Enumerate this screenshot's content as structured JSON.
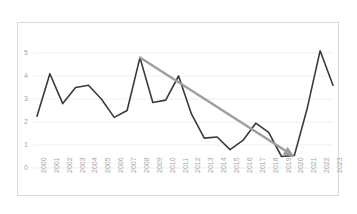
{
  "chart_data": {
    "type": "line",
    "title": "",
    "xlabel": "",
    "ylabel": "",
    "categories": [
      "2000",
      "2001",
      "2002",
      "2003",
      "2004",
      "2005",
      "2006",
      "2007",
      "2008",
      "2009",
      "2010",
      "2011",
      "2012",
      "2013",
      "2014",
      "2015",
      "2016",
      "2017",
      "2018",
      "2019",
      "2020",
      "2021",
      "2022",
      "2023"
    ],
    "values": [
      2.25,
      4.1,
      2.8,
      3.5,
      3.6,
      3.0,
      2.2,
      2.5,
      4.8,
      2.85,
      2.95,
      4.0,
      2.35,
      1.3,
      1.35,
      0.8,
      1.2,
      1.95,
      1.55,
      0.5,
      0.55,
      2.6,
      5.1,
      3.6
    ],
    "ylim": [
      0,
      5.6
    ],
    "yticks": [
      "0",
      "1",
      "2",
      "3",
      "4",
      "5"
    ],
    "ytick_values": [
      0,
      1,
      2,
      3,
      4,
      5
    ],
    "grid": true,
    "grid_axis": "y",
    "legend": false,
    "series_color": "#3a3a3a",
    "grid_color": "#eceff1",
    "tick_label_color": "#a6a6a6",
    "border_color": "#d9d9d9",
    "annotations": [
      {
        "type": "trend-arrow",
        "label": "",
        "color": "#9e9e9e",
        "from_category": "2008",
        "from_value": 4.8,
        "to_category": "2020",
        "to_value": 0.5,
        "direction": "down"
      }
    ]
  }
}
